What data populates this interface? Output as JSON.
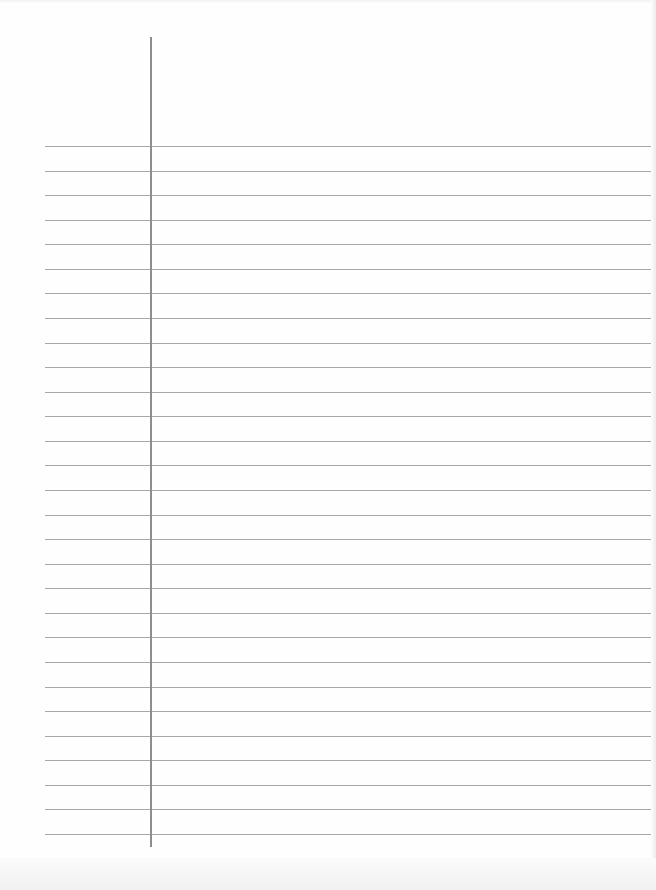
{
  "paper": {
    "kind": "lined notebook paper",
    "background": "#fefefe",
    "rules": {
      "count": 29,
      "first_y": 146,
      "spacing": 24.57,
      "left_x": 45,
      "color": "#a9a9a9"
    },
    "margin_line": {
      "x": 150,
      "top_y": 37,
      "bottom_y": 847,
      "color": "#8d8d8d"
    }
  }
}
